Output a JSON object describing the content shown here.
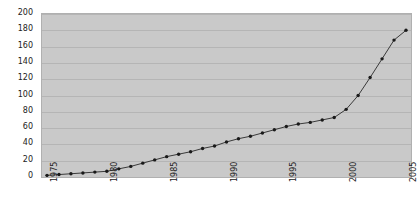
{
  "chart_data": {
    "type": "line",
    "title": "",
    "xlabel": "",
    "ylabel": "",
    "xlim": [
      1975,
      2005
    ],
    "ylim": [
      0,
      200
    ],
    "grid": true,
    "legend": "none",
    "marker": "filled-circle",
    "line_color": "#3a3a3a",
    "marker_color": "#1a1a1a",
    "plot_background": "#c9c9c9",
    "gridline_color": "#b5b5b5",
    "y_ticks": [
      0,
      20,
      40,
      60,
      80,
      100,
      120,
      140,
      160,
      180,
      200
    ],
    "y_tick_labels": [
      "0",
      "20",
      "40",
      "60",
      "80",
      "100",
      "120",
      "140",
      "160",
      "180",
      "200"
    ],
    "x_ticks": [
      1975,
      1980,
      1985,
      1990,
      1995,
      2000,
      2005
    ],
    "x_tick_labels": [
      "1975",
      "1980",
      "1985",
      "1990",
      "1995",
      "2000",
      "2005"
    ],
    "x": [
      1975,
      1976,
      1977,
      1978,
      1979,
      1980,
      1981,
      1982,
      1983,
      1984,
      1985,
      1986,
      1987,
      1988,
      1989,
      1990,
      1991,
      1992,
      1993,
      1994,
      1995,
      1996,
      1997,
      1998,
      1999,
      2000,
      2001,
      2002,
      2003,
      2004,
      2005
    ],
    "values": [
      2,
      3,
      4,
      5,
      6,
      7,
      10,
      13,
      17,
      21,
      25,
      28,
      31,
      35,
      38,
      43,
      47,
      50,
      54,
      58,
      62,
      65,
      67,
      70,
      73,
      83,
      100,
      122,
      145,
      168,
      180
    ],
    "series": [
      {
        "name": "series-1",
        "values": [
          2,
          3,
          4,
          5,
          6,
          7,
          10,
          13,
          17,
          21,
          25,
          28,
          31,
          35,
          38,
          43,
          47,
          50,
          54,
          58,
          62,
          65,
          67,
          70,
          73,
          83,
          100,
          122,
          145,
          168,
          180
        ]
      }
    ]
  }
}
